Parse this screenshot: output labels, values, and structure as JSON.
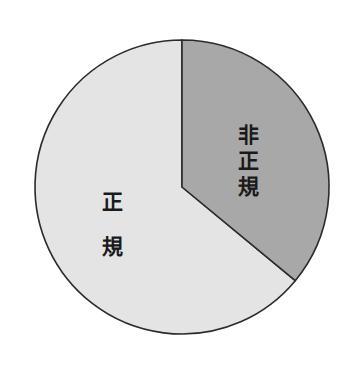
{
  "chart_data": {
    "type": "pie",
    "title": "",
    "subtitle": "",
    "xlabel": "",
    "ylabel": "",
    "grid": false,
    "legend_position": "none",
    "labels_inside_slices": true,
    "categories": [
      "非正規",
      "正規"
    ],
    "values": [
      36,
      64
    ],
    "value_unit": "%",
    "start_angle_deg": 0,
    "direction": "clockwise",
    "slices": [
      {
        "name": "非正規",
        "label": "非正規",
        "label_chars": [
          "非",
          "正",
          "規"
        ],
        "value": 36,
        "start_angle_deg": 0,
        "end_angle_deg": 129,
        "sweep_deg": 129,
        "fill": "#a8a8a8",
        "stroke": "#2b2b2b"
      },
      {
        "name": "正規",
        "label": "正規",
        "label_chars": [
          "正",
          "規"
        ],
        "value": 64,
        "start_angle_deg": 129,
        "end_angle_deg": 360,
        "sweep_deg": 231,
        "fill": "#e4e4e4",
        "stroke": "#2b2b2b"
      }
    ]
  },
  "figure": {
    "background": "#ffffff",
    "outline_color": "#2b2b2b",
    "center_x": 182,
    "center_y": 187,
    "radius": 147
  },
  "labels": {
    "nonregular": {
      "text": "非正規",
      "chars": [
        "非",
        "正",
        "規"
      ],
      "char1": "非",
      "char2": "正",
      "char3": "規"
    },
    "regular": {
      "text": "正規",
      "chars": [
        "正",
        "規"
      ],
      "char1": "正",
      "char2": "規"
    }
  }
}
